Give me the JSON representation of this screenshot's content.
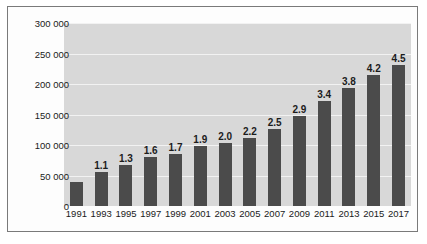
{
  "chart_data": {
    "type": "bar",
    "title": "",
    "subtitle": "",
    "xlabel": "",
    "ylabel": "",
    "categories": [
      "1991",
      "1993",
      "1995",
      "1997",
      "1999",
      "2001",
      "2003",
      "2005",
      "2007",
      "2009",
      "2011",
      "2013",
      "2015",
      "2017"
    ],
    "values": [
      39000,
      56000,
      67000,
      80000,
      86000,
      98000,
      103000,
      112000,
      127000,
      147000,
      172000,
      193000,
      214000,
      231000
    ],
    "data_labels": [
      "",
      "1.1",
      "1.3",
      "1.6",
      "1.7",
      "1.9",
      "2.0",
      "2.2",
      "2.5",
      "2.9",
      "3.4",
      "3.8",
      "4.2",
      "4.5"
    ],
    "ylim": [
      0,
      300000
    ],
    "yticks": [
      0,
      50000,
      100000,
      150000,
      200000,
      250000,
      300000
    ],
    "ytick_labels": [
      "0",
      "50 000",
      "100 000",
      "150 000",
      "200 000",
      "250 000",
      "300 000"
    ],
    "grid": true,
    "legend": false,
    "legend_position": "none",
    "colors": {
      "bar": "#4b4b4b",
      "plot_background": "#d8d8d8",
      "gridline": "#f2f2f2",
      "figure_background": "#fdfdfd",
      "frame_border": "#7a7a7a",
      "text": "#1a1a1a"
    }
  }
}
